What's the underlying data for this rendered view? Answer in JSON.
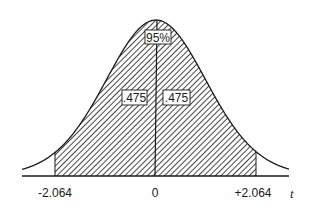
{
  "chart_data": {
    "type": "area",
    "title": "",
    "distribution": "Student t (df = 24)",
    "xlabel": "t",
    "ylabel": "",
    "x_ticks": [
      "-2.064",
      "0",
      "+2.064"
    ],
    "x_tick_values": [
      -2.064,
      0,
      2.064
    ],
    "shaded_region": {
      "from": -2.064,
      "to": 2.064
    },
    "annotations": [
      {
        "text": "95%",
        "position": "center-top",
        "meaning": "total shaded area"
      },
      {
        "text": ".475",
        "position": "left-of-center",
        "meaning": "area from -2.064 to 0"
      },
      {
        "text": ".475",
        "position": "right-of-center",
        "meaning": "area from 0 to +2.064"
      }
    ],
    "areas": {
      "total": 0.95,
      "left_half": 0.475,
      "right_half": 0.475
    },
    "grid": false,
    "legend": null
  },
  "labels": {
    "center_pct": "95%",
    "left_area": ".475",
    "right_area": ".475",
    "tick_left": "-2.064",
    "tick_center": "0",
    "tick_right": "+2.064",
    "axis_var": "t"
  },
  "colors": {
    "ink": "#1a1a1a",
    "background": "#ffffff"
  }
}
